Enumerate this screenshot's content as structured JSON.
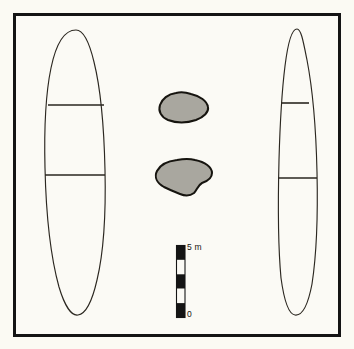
{
  "figure": {
    "kind": "archaeological-site-plan",
    "width": 354,
    "height": 349,
    "background_color": "#fbfaf3",
    "plate_color": "#fbfaf5",
    "frame_color": "#141414",
    "line_color": "#2b2720",
    "stone_fill_color": "#a9a79f",
    "stone_outline_color": "#16140f"
  },
  "scalebar": {
    "orientation": "vertical",
    "top_label": "5 m",
    "bottom_label": "0",
    "units": "m",
    "max_value": 5,
    "min_value": 0,
    "segment_count": 5,
    "segment_colors": [
      "#141414",
      "#fbfaf5",
      "#141414",
      "#fbfaf5",
      "#141414"
    ],
    "x": 176,
    "y_top": 245,
    "y_bottom": 318,
    "bar_width": 9
  },
  "features": [
    {
      "id": "feature-west",
      "label": "west-elongated-mound",
      "type": "outlined-elongated-oval",
      "divider_count": 2,
      "bounds": {
        "x": 46,
        "y": 30,
        "width": 59,
        "height": 285
      },
      "path": "M 76 30 C 64 30 56 44 51 68 C 46 92 44 128 45 168 C 46 212 51 258 59 287 C 65 307 72 316 78 315 C 85 314 92 302 97 280 C 103 255 106 214 105 170 C 104 126 100 86 94 62 C 89 41 83 30 76 30 Z",
      "dividers": [
        {
          "y": 105,
          "x1": 48,
          "x2": 104
        },
        {
          "y": 175,
          "x1": 45,
          "x2": 105
        }
      ]
    },
    {
      "id": "feature-east",
      "label": "east-elongated-mound",
      "type": "outlined-elongated-oval",
      "divider_count": 2,
      "bounds": {
        "x": 277,
        "y": 29,
        "width": 41,
        "height": 286
      },
      "path": "M 297 29 C 292 29 288 42 285 66 C 282 90 280 124 279 160 C 278 200 278 246 281 278 C 284 300 288 314 295 315 C 302 316 308 305 312 284 C 316 258 318 216 317 172 C 316 128 312 86 307 60 C 303 40 301 29 297 29 Z",
      "dividers": [
        {
          "y": 103,
          "x1": 281,
          "x2": 309
        },
        {
          "y": 178,
          "x1": 278,
          "x2": 317
        }
      ]
    },
    {
      "id": "stone-upper",
      "label": "upper-stone-setting",
      "type": "filled-irregular-blob",
      "bounds": {
        "x": 159,
        "y": 92,
        "width": 50,
        "height": 31
      },
      "path": "M 176 93 C 168 94 162 99 160 105 C 158 111 161 117 168 120 C 176 123 187 123 196 120 C 204 117 209 112 208 107 C 207 101 200 96 191 94 C 185 92 180 92 176 93 Z"
    },
    {
      "id": "stone-lower",
      "label": "lower-stone-setting",
      "type": "filled-irregular-blob",
      "bounds": {
        "x": 156,
        "y": 159,
        "width": 57,
        "height": 37
      },
      "path": "M 177 160 C 168 161 160 165 157 171 C 154 177 157 183 164 187 C 170 190 175 192 180 194 C 185 196 190 196 194 193 C 197 190 198 185 202 183 C 208 181 212 178 212 173 C 212 167 205 162 195 160 C 188 158 182 159 177 160 Z"
    }
  ]
}
